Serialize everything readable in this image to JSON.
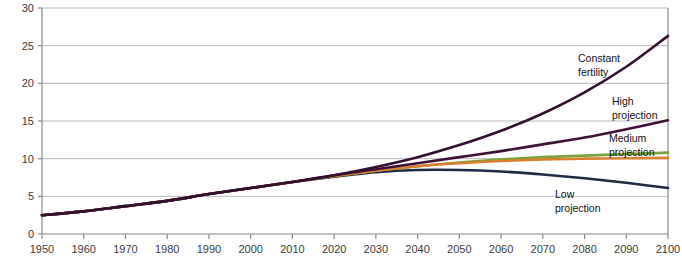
{
  "chart_data": {
    "type": "line",
    "title": "",
    "xlabel": "",
    "ylabel": "Population (Billions)",
    "xlim": [
      1950,
      2100
    ],
    "ylim": [
      0,
      30
    ],
    "grid": true,
    "legend_position": "inline-annotations",
    "x_ticks": [
      "1950",
      "1960",
      "1970",
      "1980",
      "1990",
      "2000",
      "2010",
      "2020",
      "2030",
      "2040",
      "2050",
      "2060",
      "2070",
      "2080",
      "2090",
      "2100"
    ],
    "y_ticks": [
      "0",
      "5",
      "10",
      "15",
      "20",
      "25",
      "30"
    ],
    "x": [
      1950,
      1960,
      1970,
      1980,
      1990,
      2000,
      2010,
      2020,
      2030,
      2040,
      2050,
      2060,
      2070,
      2080,
      2090,
      2100
    ],
    "series": [
      {
        "name": "Constant fertility",
        "color": "#33102f",
        "label": "Constant\nfertility",
        "label_line1": "Constant",
        "label_line2": "fertility",
        "values": [
          2.5,
          3.0,
          3.7,
          4.4,
          5.3,
          6.1,
          6.9,
          7.8,
          8.9,
          10.2,
          11.8,
          13.7,
          16.0,
          18.8,
          22.2,
          26.3
        ]
      },
      {
        "name": "High projection",
        "color": "#3f1038",
        "label": "High\nprojection",
        "label_line1": "High",
        "label_line2": "projection",
        "values": [
          2.5,
          3.0,
          3.7,
          4.4,
          5.3,
          6.1,
          6.9,
          7.8,
          8.6,
          9.4,
          10.2,
          11.0,
          11.9,
          12.8,
          13.9,
          15.1
        ]
      },
      {
        "name": "Medium projection",
        "color": "#76a33c",
        "label": "Medium\nprojection",
        "label_line1": "Medium",
        "label_line2": "projection",
        "values": [
          2.5,
          3.0,
          3.7,
          4.4,
          5.3,
          6.1,
          6.9,
          7.7,
          8.4,
          9.0,
          9.5,
          9.9,
          10.2,
          10.4,
          10.6,
          10.8
        ]
      },
      {
        "name": "Instant replacement fertility",
        "color": "#d9802f",
        "label": "",
        "label_line1": "",
        "label_line2": "",
        "values": [
          2.5,
          3.0,
          3.7,
          4.4,
          5.3,
          6.1,
          6.9,
          7.7,
          8.4,
          9.0,
          9.4,
          9.7,
          9.9,
          10.0,
          10.05,
          10.1
        ]
      },
      {
        "name": "Low projection",
        "color": "#202a43",
        "label": "Low\nprojection",
        "label_line1": "Low",
        "label_line2": "projection",
        "values": [
          2.5,
          3.0,
          3.7,
          4.4,
          5.3,
          6.1,
          6.9,
          7.6,
          8.2,
          8.5,
          8.5,
          8.3,
          7.9,
          7.4,
          6.8,
          6.1
        ]
      }
    ]
  }
}
